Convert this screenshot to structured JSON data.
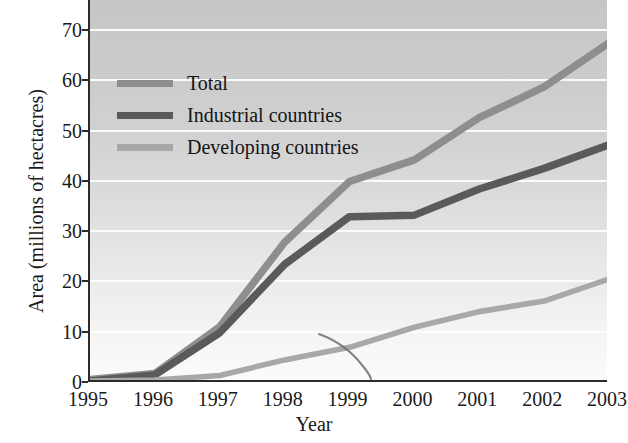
{
  "chart_data": {
    "type": "line",
    "title": "",
    "xlabel": "Year",
    "ylabel": "Area (millions of hectacres)",
    "x": [
      1995,
      1996,
      1997,
      1998,
      1999,
      2000,
      2001,
      2002,
      2003
    ],
    "xlim": [
      1995,
      2003
    ],
    "ylim": [
      0,
      76
    ],
    "yticks": [
      0,
      10,
      20,
      30,
      40,
      50,
      60,
      70
    ],
    "xticks": [
      1995,
      1996,
      1997,
      1998,
      1999,
      2000,
      2001,
      2002,
      2003
    ],
    "grid": "horizontal white gridlines at each y tick",
    "legend_position": "inside upper-left",
    "series": [
      {
        "name": "Total",
        "color": "#8e8e8e",
        "values": [
          0.5,
          1.7,
          11.0,
          27.8,
          39.9,
          44.2,
          52.6,
          58.7,
          67.5
        ]
      },
      {
        "name": "Industrial countries",
        "color": "#5a5a5a",
        "values": [
          0.2,
          1.4,
          9.8,
          23.4,
          32.9,
          33.2,
          38.4,
          42.5,
          47.2
        ]
      },
      {
        "name": "Developing countries",
        "color": "#a8a8a8",
        "values": [
          0.2,
          0.4,
          1.3,
          4.4,
          6.9,
          10.9,
          14.0,
          16.1,
          20.5
        ]
      }
    ],
    "artifact_note": "thin dark ink/scan artifact curve descending to the baseline near 1999.5"
  },
  "axes": {
    "y_tick_labels": [
      "0",
      "10",
      "20",
      "30",
      "40",
      "50",
      "60",
      "70"
    ],
    "x_tick_labels": [
      "1995",
      "1996",
      "1997",
      "1998",
      "1999",
      "2000",
      "2001",
      "2002",
      "2003"
    ],
    "y_axis_title": "Area (millions of hectacres)",
    "x_axis_title": "Year"
  },
  "legend": {
    "items": [
      {
        "label": "Total",
        "color": "#8e8e8e"
      },
      {
        "label": "Industrial countries",
        "color": "#5a5a5a"
      },
      {
        "label": "Developing countries",
        "color": "#a8a8a8"
      }
    ]
  },
  "colors": {
    "total": "#8e8e8e",
    "industrial": "#5a5a5a",
    "developing": "#a8a8a8",
    "axis": "#2b2b2b",
    "gridline": "#fdfdfd",
    "plot_bg_top": "#c6c6c6",
    "plot_bg_bottom": "#fbfbfb",
    "text": "#1a1a1a"
  }
}
